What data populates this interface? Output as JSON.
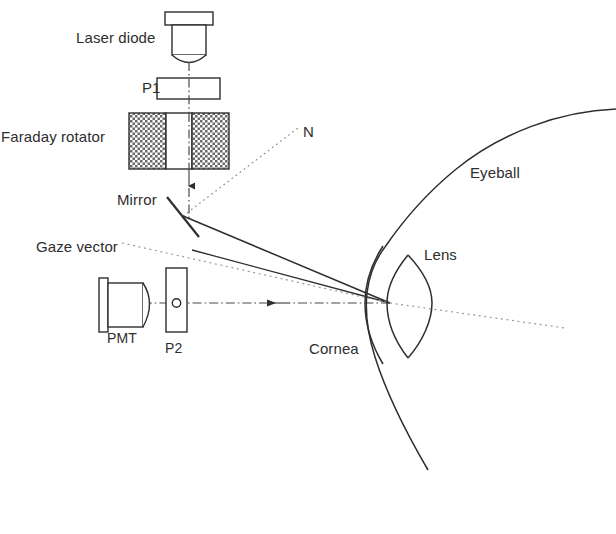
{
  "figure": {
    "type": "optical-schematic",
    "background_color": "#ffffff",
    "line_color": "#2e2e2e",
    "hatch_color": "#555555",
    "width": 616,
    "height": 534
  },
  "labels": {
    "laser_diode": "Laser diode",
    "p1": "P1",
    "faraday_rotator": "Faraday rotator",
    "mirror": "Mirror",
    "normal": "N",
    "gaze_vector": "Gaze vector",
    "pmt": "PMT",
    "p2": "P2",
    "cornea": "Cornea",
    "lens": "Lens",
    "eyeball": "Eyeball"
  },
  "components": [
    {
      "name": "laser-diode",
      "label": "Laser diode",
      "kind": "source",
      "x": 190,
      "y": 40
    },
    {
      "name": "polarizer-p1",
      "label": "P1",
      "kind": "polarizer",
      "x": 190,
      "y": 89
    },
    {
      "name": "faraday-rotator",
      "label": "Faraday rotator",
      "kind": "rotator",
      "x": 190,
      "y": 142
    },
    {
      "name": "mirror",
      "label": "Mirror",
      "kind": "mirror",
      "x": 184,
      "y": 213
    },
    {
      "name": "polarizer-p2",
      "label": "P2",
      "kind": "polarizer",
      "x": 176,
      "y": 303
    },
    {
      "name": "pmt-detector",
      "label": "PMT",
      "kind": "detector",
      "x": 122,
      "y": 303
    },
    {
      "name": "eye-cornea",
      "label": "Cornea",
      "kind": "anatomy",
      "x": 372,
      "y": 303
    },
    {
      "name": "eye-lens",
      "label": "Lens",
      "kind": "anatomy",
      "x": 405,
      "y": 300
    },
    {
      "name": "eyeball",
      "label": "Eyeball",
      "kind": "anatomy",
      "x": 470,
      "y": 230
    }
  ],
  "rays": [
    {
      "name": "emission-beam",
      "style": "dash-dot",
      "from": "laser-diode",
      "to": "mirror",
      "direction": "down"
    },
    {
      "name": "illumination-beam",
      "style": "solid",
      "from": "mirror",
      "to": "eye-focus"
    },
    {
      "name": "return-beam",
      "style": "solid",
      "from": "eye-focus",
      "to": "mirror-region"
    },
    {
      "name": "detection-beam",
      "style": "dash-dot",
      "from": "eye-focus",
      "to": "pmt-detector",
      "direction": "left"
    },
    {
      "name": "surface-normal",
      "style": "dotted",
      "from": "mirror",
      "to": "normal-label"
    },
    {
      "name": "gaze-vector-line",
      "style": "dotted",
      "from": "gaze-label",
      "to": "eye-posterior"
    }
  ],
  "label_positions": {
    "laser_diode": {
      "x": 76,
      "y": 30
    },
    "p1": {
      "x": 142,
      "y": 80
    },
    "faraday_rotator": {
      "x": 4,
      "y": 129
    },
    "mirror": {
      "x": 117,
      "y": 192
    },
    "normal": {
      "x": 303,
      "y": 124
    },
    "gaze_vector": {
      "x": 36,
      "y": 239
    },
    "pmt": {
      "x": 107,
      "y": 331
    },
    "p2": {
      "x": 165,
      "y": 341
    },
    "cornea": {
      "x": 309,
      "y": 341
    },
    "lens": {
      "x": 424,
      "y": 247
    },
    "eyeball": {
      "x": 470,
      "y": 165
    }
  }
}
